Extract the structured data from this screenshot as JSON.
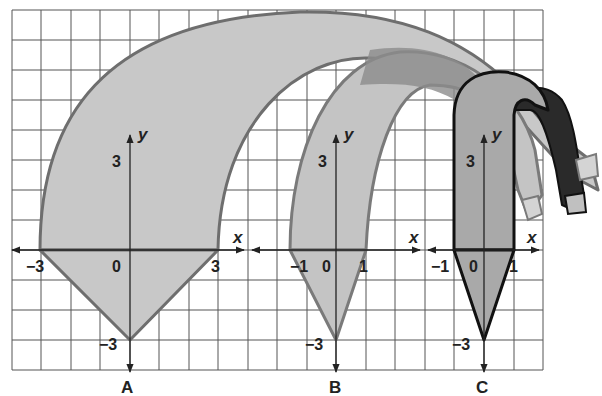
{
  "figure": {
    "grid": {
      "cell_px": 29.5,
      "x_lines": [
        12,
        41,
        71,
        100,
        130,
        159,
        189,
        218,
        248,
        277,
        307,
        336,
        366,
        395,
        425,
        454,
        484,
        514,
        543
      ],
      "y_lines": [
        10,
        40,
        70,
        100,
        130,
        160,
        190,
        220,
        250,
        280,
        310,
        340,
        370
      ],
      "line_color": "#555555"
    },
    "panels": [
      {
        "id": "A",
        "label": "A",
        "x_axis_label": "x",
        "y_axis_label": "y",
        "origin_label": "0",
        "x_tick_labels": [
          "−3",
          "3"
        ],
        "y_tick_labels": [
          "3",
          "−3"
        ],
        "shape_vertices": [
          [
            -3,
            0
          ],
          [
            0,
            -3
          ],
          [
            3,
            0
          ]
        ],
        "fill": "#c8c8c8",
        "stroke": "#6e6e6e"
      },
      {
        "id": "B",
        "label": "B",
        "x_axis_label": "x",
        "y_axis_label": "y",
        "origin_label": "0",
        "x_tick_labels": [
          "−1",
          "1"
        ],
        "y_tick_labels": [
          "3",
          "−3"
        ],
        "shape_vertices": [
          [
            -1.5,
            0
          ],
          [
            0,
            -3
          ],
          [
            1,
            0
          ]
        ],
        "fill": "#c6c6c6",
        "stroke": "#7a7a7a"
      },
      {
        "id": "C",
        "label": "C",
        "x_axis_label": "x",
        "y_axis_label": "y",
        "origin_label": "0",
        "x_tick_labels": [
          "−1",
          "1"
        ],
        "y_tick_labels": [
          "3",
          "−3"
        ],
        "shape_vertices": [
          [
            -1,
            0
          ],
          [
            0,
            -3
          ],
          [
            1,
            0
          ]
        ],
        "fill": "#a9a9a9",
        "stroke": "#111111"
      }
    ],
    "colors": {
      "ribbon_light": "#c8c8c8",
      "ribbon_mid": "#8c8c8c",
      "ribbon_dark": "#2a2a2a",
      "tip_fill": "#d4d4d4"
    }
  }
}
